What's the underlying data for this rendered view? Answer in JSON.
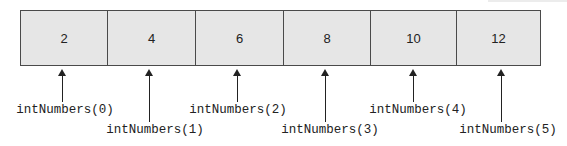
{
  "diagram": {
    "title": "",
    "array_name": "intNumbers",
    "cells": [
      {
        "value": "2",
        "label": "intNumbers(0)"
      },
      {
        "value": "4",
        "label": "intNumbers(1)"
      },
      {
        "value": "6",
        "label": "intNumbers(2)"
      },
      {
        "value": "8",
        "label": "intNumbers(3)"
      },
      {
        "value": "10",
        "label": "intNumbers(4)"
      },
      {
        "value": "12",
        "label": "intNumbers(5)"
      }
    ]
  },
  "colors": {
    "cell_fill": "#e6e6e6",
    "border": "#4a4a4a",
    "text": "#222222"
  }
}
